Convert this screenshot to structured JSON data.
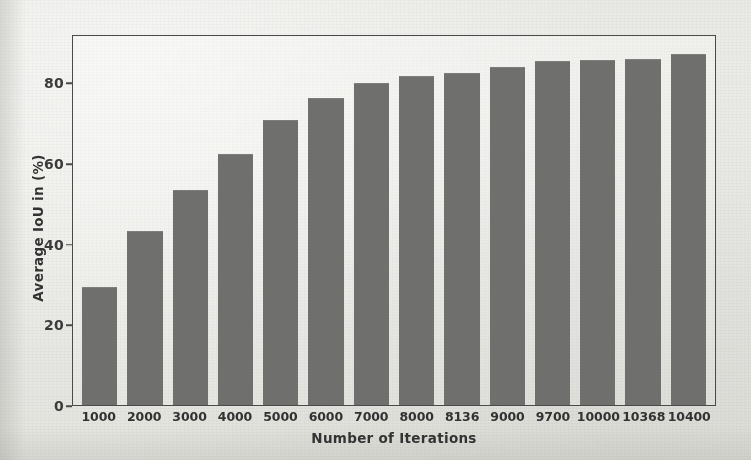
{
  "chart_data": {
    "type": "bar",
    "title": "",
    "xlabel": "Number of Iterations",
    "ylabel": "Average IoU in (%)",
    "categories": [
      "1000",
      "2000",
      "3000",
      "4000",
      "5000",
      "6000",
      "7000",
      "8000",
      "8136",
      "9000",
      "9700",
      "10000",
      "10368",
      "10400"
    ],
    "values": [
      29.5,
      43.5,
      53.5,
      62.5,
      71.0,
      76.5,
      80.3,
      82.0,
      82.7,
      84.3,
      85.8,
      86.0,
      86.2,
      87.5
    ],
    "ylim": [
      0,
      92
    ],
    "yticks": [
      0,
      20,
      40,
      60,
      80
    ],
    "ytick_labels": [
      "0",
      "20",
      "40",
      "60",
      "80"
    ],
    "grid": false,
    "legend": null,
    "series": [
      {
        "name": "Average IoU",
        "values": [
          29.5,
          43.5,
          53.5,
          62.5,
          71.0,
          76.5,
          80.3,
          82.0,
          82.7,
          84.3,
          85.8,
          86.0,
          86.2,
          87.5
        ]
      }
    ],
    "bar_color": "#6f6f6e",
    "axis_color": "#4a4a4a",
    "background_color": "#ebebe7"
  }
}
